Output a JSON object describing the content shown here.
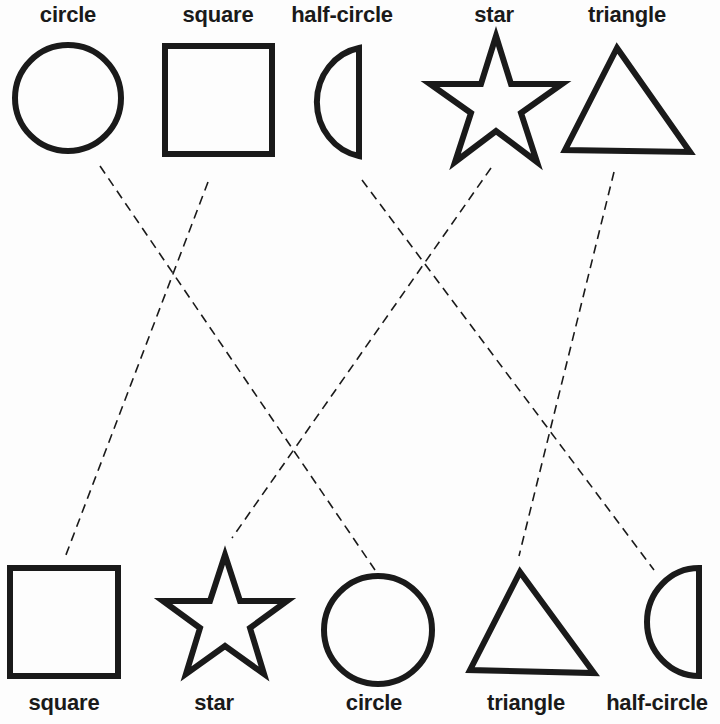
{
  "top_row": {
    "labels": [
      "circle",
      "square",
      "half-circle",
      "star",
      "triangle"
    ]
  },
  "bottom_row": {
    "labels": [
      "square",
      "star",
      "circle",
      "triangle",
      "half-circle"
    ]
  },
  "connections": [
    {
      "from": "circle",
      "to": "circle"
    },
    {
      "from": "square",
      "to": "square"
    },
    {
      "from": "half-circle",
      "to": "half-circle"
    },
    {
      "from": "star",
      "to": "star"
    },
    {
      "from": "triangle",
      "to": "triangle"
    }
  ],
  "colors": {
    "ink": "#1a1a1a",
    "paper": "#fdfdfd"
  }
}
